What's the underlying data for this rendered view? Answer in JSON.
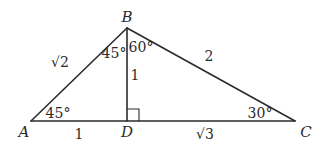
{
  "diagram": {
    "type": "triangle-with-altitude",
    "vertices": {
      "A": {
        "label": "A",
        "x": 31,
        "y": 121
      },
      "B": {
        "label": "B",
        "x": 127,
        "y": 28
      },
      "C": {
        "label": "C",
        "x": 295,
        "y": 121
      },
      "D": {
        "label": "D",
        "x": 127,
        "y": 121
      }
    },
    "sides": {
      "AB": "√2",
      "BC": "2",
      "BD": "1",
      "AD": "1",
      "DC": "√3"
    },
    "angles": {
      "A": "45°",
      "ABD": "45°",
      "DBC": "60°",
      "C": "30°"
    },
    "right_angle_at": "D",
    "line_color": "#2b2b2b"
  }
}
